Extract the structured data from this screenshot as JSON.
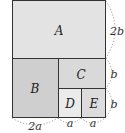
{
  "regions": {
    "A": {
      "label": "A",
      "color": "#e3e3e3"
    },
    "B": {
      "label": "B",
      "color": "#cfcfcf"
    },
    "C": {
      "label": "C",
      "color": "#d9d9d9"
    },
    "D": {
      "label": "D",
      "color": "#ebebeb"
    },
    "E": {
      "label": "E",
      "color": "#dcdcdc"
    }
  },
  "dimensions": {
    "right_top": "2b",
    "right_mid": "b",
    "right_bottom": "b",
    "bottom_left": "2a",
    "bottom_mid": "a",
    "bottom_right": "a"
  },
  "colors": {
    "border": "#333333",
    "dotted": "#888888"
  }
}
